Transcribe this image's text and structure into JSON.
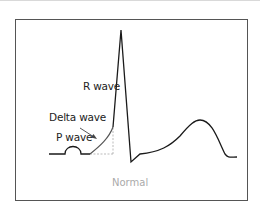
{
  "diagram": {
    "type": "ecg-waveform",
    "labels": {
      "r_wave": "R wave",
      "delta_wave": "Delta wave",
      "p_wave": "P wave"
    },
    "caption": "Normal",
    "colors": {
      "trace": "#1a1a1a",
      "dashed": "#aaaaaa",
      "delta": "#555555",
      "frame": "#555555",
      "caption": "#aaaaaa"
    }
  }
}
